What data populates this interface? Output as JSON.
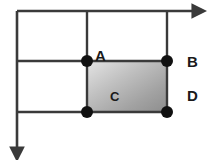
{
  "diagram": {
    "type": "geometry-line-diagram",
    "canvas": {
      "width": 210,
      "height": 160,
      "background": "#ffffff"
    },
    "colors": {
      "line": "#3a3a3a",
      "dot": "#111111",
      "shade_light": "#e8e8e8",
      "shade_mid": "#b4b4b4",
      "shade_dark": "#8a8a8a",
      "label": "#1a1a1a"
    },
    "axes": [
      {
        "name": "horizontal-axis",
        "orientation": "horizontal",
        "from": {
          "x": 17,
          "y": 11
        },
        "to": {
          "x": 197,
          "y": 11
        },
        "arrowhead": "end"
      },
      {
        "name": "vertical-axis",
        "orientation": "vertical",
        "from": {
          "x": 17,
          "y": 11
        },
        "to": {
          "x": 17,
          "y": 152
        },
        "arrowhead": "end"
      }
    ],
    "gridlines": [
      {
        "name": "vertical-gridline-left",
        "orientation": "vertical",
        "from": {
          "x": 87,
          "y": 11
        },
        "to": {
          "x": 87,
          "y": 112
        }
      },
      {
        "name": "vertical-gridline-right",
        "orientation": "vertical",
        "from": {
          "x": 167,
          "y": 11
        },
        "to": {
          "x": 167,
          "y": 112
        }
      },
      {
        "name": "horizontal-gridline-upper",
        "orientation": "horizontal",
        "from": {
          "x": 17,
          "y": 61
        },
        "to": {
          "x": 167,
          "y": 61
        }
      },
      {
        "name": "horizontal-gridline-lower",
        "orientation": "horizontal",
        "from": {
          "x": 17,
          "y": 112
        },
        "to": {
          "x": 167,
          "y": 112
        }
      }
    ],
    "region": {
      "name": "shaded-rectangle",
      "x": 87,
      "y": 61,
      "width": 80,
      "height": 51,
      "fill": "gradient-gray-diagonal"
    },
    "vertices": [
      {
        "id": "top-left",
        "x": 87,
        "y": 61,
        "radius": 6
      },
      {
        "id": "top-right",
        "x": 167,
        "y": 61,
        "radius": 6
      },
      {
        "id": "bottom-left",
        "x": 87,
        "y": 112,
        "radius": 6
      },
      {
        "id": "bottom-right",
        "x": 167,
        "y": 112,
        "radius": 6
      }
    ],
    "labels": [
      {
        "id": "label-a",
        "text": "A",
        "x": 95,
        "y": 61,
        "anchor": "start",
        "size": 15
      },
      {
        "id": "label-b",
        "text": "B",
        "x": 187,
        "y": 67,
        "anchor": "start",
        "size": 15
      },
      {
        "id": "label-c",
        "text": "C",
        "x": 110,
        "y": 101,
        "anchor": "start",
        "size": 13
      },
      {
        "id": "label-d",
        "text": "D",
        "x": 187,
        "y": 101,
        "anchor": "start",
        "size": 15
      }
    ]
  }
}
